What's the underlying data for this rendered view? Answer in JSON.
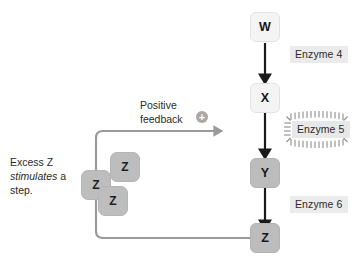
{
  "diagram": {
    "colors": {
      "node_light": "#f4f4f4",
      "node_mid": "#bcbcbc",
      "enzyme_chip": "#ebebeb",
      "arrow_dark": "#1a1a1a",
      "feedback_line": "#9a9a9a",
      "plus_badge": "#a8a8a8",
      "background": "#ffffff"
    },
    "pathway": {
      "nodes": [
        {
          "label": "W",
          "shade": "light"
        },
        {
          "label": "X",
          "shade": "light"
        },
        {
          "label": "Y",
          "shade": "mid"
        },
        {
          "label": "Z",
          "shade": "mid"
        }
      ],
      "steps": [
        {
          "enzyme": "Enzyme 4",
          "from": "W",
          "to": "X",
          "activated": false
        },
        {
          "enzyme": "Enzyme 5",
          "from": "X",
          "to": "Y",
          "activated": true
        },
        {
          "enzyme": "Enzyme 6",
          "from": "Y",
          "to": "Z",
          "activated": false
        }
      ]
    },
    "feedback": {
      "label_line1": "Positive",
      "label_line2": "feedback",
      "sign": "+",
      "source": "Z",
      "target": "Enzyme 5"
    },
    "annotation": {
      "line1": "Excess Z",
      "line2_italic": "stimulates",
      "line2_rest": " a",
      "line3": "step."
    },
    "free_molecules": [
      {
        "label": "Z"
      },
      {
        "label": "Z"
      },
      {
        "label": "Z"
      }
    ]
  }
}
